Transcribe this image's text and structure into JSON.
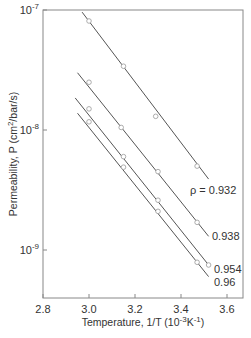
{
  "chart_data": {
    "type": "scatter",
    "title": "",
    "xlabel": "Temperature, 1/T  (10^-3 K^-1)",
    "xlabel_parts": {
      "main": "Temperature, 1/T  (10",
      "sup1": "-3",
      "mid": "K",
      "sup2": "-1",
      "end": ")"
    },
    "ylabel": "Permeability, P (cm2/bar/s)",
    "ylabel_parts": {
      "main": "Permeability,  P  (cm",
      "sup": "2",
      "end": "/bar/s)"
    },
    "xlim": [
      2.8,
      3.65
    ],
    "ylim": [
      4e-10,
      1e-07
    ],
    "yscale": "log",
    "grid": false,
    "x_ticks": [
      "2.8",
      "3.0",
      "3.2",
      "3.4",
      "3.6"
    ],
    "x_tick_values": [
      2.8,
      3.0,
      3.2,
      3.4,
      3.6
    ],
    "y_ticks": [
      {
        "base": "10",
        "exp": "-7",
        "value": 1e-07
      },
      {
        "base": "10",
        "exp": "-8",
        "value": 1e-08
      },
      {
        "base": "10",
        "exp": "-9",
        "value": 1e-09
      }
    ],
    "series": [
      {
        "name": "ρ = 0.932",
        "label": "ρ = 0.932",
        "x": [
          3.0,
          3.15,
          3.29,
          3.47
        ],
        "values": [
          8.1e-08,
          3.4e-08,
          1.3e-08,
          5e-09
        ],
        "fit_x": [
          2.97,
          3.52
        ],
        "fit_y": [
          9.6e-08,
          3.9e-09
        ]
      },
      {
        "name": "0.938",
        "label": "0.938",
        "x": [
          3.0,
          3.14,
          3.3,
          3.47
        ],
        "values": [
          2.5e-08,
          1.05e-08,
          4.5e-09,
          1.7e-09
        ],
        "fit_x": [
          2.95,
          3.52
        ],
        "fit_y": [
          3e-08,
          1.3e-09
        ]
      },
      {
        "name": "0.954",
        "label": "0.954",
        "x": [
          3.0,
          3.15,
          3.3,
          3.52
        ],
        "values": [
          1.5e-08,
          6e-09,
          2.6e-09,
          7.5e-10
        ],
        "fit_x": [
          2.94,
          3.52
        ],
        "fit_y": [
          1.85e-08,
          7.5e-10
        ]
      },
      {
        "name": "0.96",
        "label": "0.96",
        "x": [
          3.0,
          3.15,
          3.3,
          3.47
        ],
        "values": [
          1.17e-08,
          4.9e-09,
          2.1e-09,
          7.9e-10
        ],
        "fit_x": [
          2.95,
          3.52
        ],
        "fit_y": [
          1.38e-08,
          6e-10
        ]
      }
    ],
    "annotations": [
      "ρ = 0.932",
      "0.938",
      "0.954",
      "0.96"
    ]
  },
  "colors": {
    "line": "#555555",
    "axis": "#888888",
    "marker_edge": "#999999",
    "text": "#333333"
  }
}
